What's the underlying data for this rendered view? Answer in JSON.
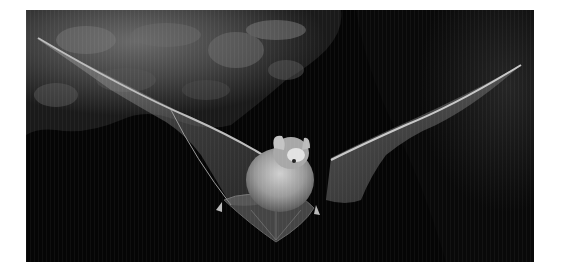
{
  "image": {
    "subject": "bat in flight",
    "description": "Grayscale photograph of a bat flying toward the camera with wings spread, against a dark cave rock background",
    "colors": {
      "background_page": "#ffffff",
      "shadow": "#050505",
      "rock_light": "#5e5e5e",
      "rock_mid": "#3a3a3a",
      "wing_membrane": "#8a8a8a",
      "body_fur": "#b8b8b8",
      "highlight": "#e8e8e8"
    }
  }
}
